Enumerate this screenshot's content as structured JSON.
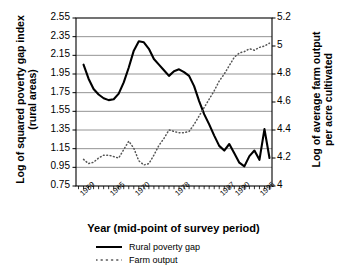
{
  "chart_data": {
    "type": "line",
    "title": "",
    "xlabel": "Year (mid-point of survey period)",
    "ylabel": "Log of squared poverty gap index\n(rural areas)",
    "y2label": "Log of average farm output\nper acre cultivated",
    "grid": true,
    "legend_position": "bottom-left",
    "xlim": [
      1957.5,
      1996.5
    ],
    "ylim": [
      0.75,
      2.55
    ],
    "y2lim": [
      4.0,
      5.2
    ],
    "yticks": [
      "2.55",
      "2.35",
      "2.15",
      "1.95",
      "1.75",
      "1.55",
      "1.35",
      "1.15",
      "0.95",
      "0.75"
    ],
    "ytick_values": [
      2.55,
      2.35,
      2.15,
      1.95,
      1.75,
      1.55,
      1.35,
      1.15,
      0.95,
      0.75
    ],
    "y2ticks": [
      "5.2",
      "5",
      "4.8",
      "4.6",
      "4.4",
      "4.2",
      "4"
    ],
    "y2tick_values": [
      5.2,
      5.0,
      4.8,
      4.6,
      4.4,
      4.2,
      4.0
    ],
    "xticks": [
      "1959",
      "1965",
      "1970",
      "1978",
      "1987",
      "1990",
      "1995"
    ],
    "xtick_values": [
      1959,
      1965,
      1970,
      1978,
      1987,
      1990,
      1995
    ],
    "series": [
      {
        "name": "Rural poverty gap",
        "axis": "left",
        "style": "solid",
        "color": "#000000",
        "x": [
          1959,
          1960,
          1961,
          1962,
          1963,
          1964,
          1965,
          1966,
          1967,
          1968,
          1969,
          1970,
          1971,
          1972,
          1973,
          1974,
          1975,
          1976,
          1977,
          1978,
          1979,
          1980,
          1981,
          1982,
          1983,
          1984,
          1985,
          1986,
          1987,
          1988,
          1989,
          1990,
          1991,
          1992,
          1993,
          1994,
          1995,
          1996
        ],
        "values": [
          2.05,
          1.9,
          1.79,
          1.73,
          1.69,
          1.67,
          1.68,
          1.74,
          1.86,
          2.02,
          2.2,
          2.3,
          2.29,
          2.22,
          2.11,
          2.05,
          1.99,
          1.93,
          1.98,
          2.0,
          1.97,
          1.93,
          1.82,
          1.66,
          1.52,
          1.41,
          1.29,
          1.18,
          1.13,
          1.2,
          1.1,
          1.0,
          0.96,
          1.07,
          1.13,
          1.03,
          1.36,
          1.05
        ]
      },
      {
        "name": "Farm output",
        "axis": "right",
        "style": "dotted",
        "color": "#555555",
        "x": [
          1959,
          1960,
          1961,
          1962,
          1963,
          1964,
          1965,
          1966,
          1967,
          1968,
          1969,
          1970,
          1971,
          1972,
          1973,
          1974,
          1975,
          1976,
          1977,
          1978,
          1979,
          1980,
          1981,
          1982,
          1983,
          1984,
          1985,
          1986,
          1987,
          1988,
          1989,
          1990,
          1991,
          1992,
          1993,
          1994,
          1995,
          1996
        ],
        "values": [
          4.19,
          4.16,
          4.17,
          4.2,
          4.22,
          4.22,
          4.21,
          4.2,
          4.26,
          4.32,
          4.27,
          4.18,
          4.15,
          4.16,
          4.22,
          4.29,
          4.34,
          4.4,
          4.39,
          4.38,
          4.38,
          4.39,
          4.44,
          4.5,
          4.56,
          4.62,
          4.68,
          4.75,
          4.8,
          4.86,
          4.92,
          4.95,
          4.96,
          4.98,
          4.97,
          4.99,
          5.0,
          5.02
        ]
      }
    ]
  },
  "legend": {
    "items": [
      {
        "label": "Rural poverty gap",
        "style": "solid"
      },
      {
        "label": "Farm output",
        "style": "dotted"
      }
    ]
  }
}
